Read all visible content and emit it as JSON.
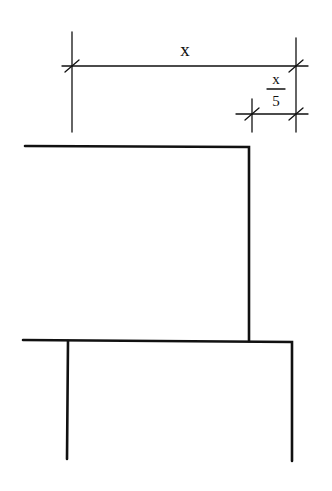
{
  "diagram": {
    "type": "dimensioned technical drawing",
    "colors": {
      "ink": "#111111",
      "background": "#ffffff"
    },
    "dimensions": {
      "overall": {
        "label": "x"
      },
      "offset": {
        "label_numerator": "x",
        "label_denominator": "5"
      }
    },
    "shapes": [
      {
        "name": "upper-member",
        "description": "horizontal line with right-hand vertical drop"
      },
      {
        "name": "lower-member",
        "description": "horizontal line with two vertical legs"
      }
    ]
  }
}
